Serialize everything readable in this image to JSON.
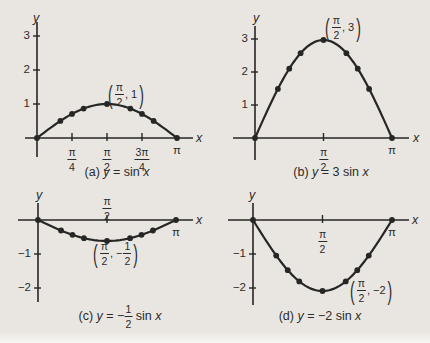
{
  "page": {
    "background": "#e9e6e1",
    "ink": "#262626"
  },
  "chart_data": [
    {
      "id": "a",
      "type": "line",
      "caption_segments": [
        {
          "text": "(a) "
        },
        {
          "text": "y",
          "italic": true
        },
        {
          "text": " = sin "
        },
        {
          "text": "x",
          "italic": true
        }
      ],
      "amplitude": 1,
      "x_axis": {
        "label": "x",
        "range_over_pi": [
          0,
          1
        ],
        "ticks": [
          {
            "value_over_pi": 0.25,
            "frac": [
              "π",
              "4"
            ],
            "side": "below",
            "mark": true
          },
          {
            "value_over_pi": 0.5,
            "frac": [
              "π",
              "2"
            ],
            "side": "below",
            "mark": true
          },
          {
            "value_over_pi": 0.75,
            "frac": [
              "3π",
              "4"
            ],
            "side": "below",
            "mark": true
          },
          {
            "value_over_pi": 1,
            "label": "π",
            "side": "below",
            "mark": false
          }
        ]
      },
      "y_axis": {
        "label": "y",
        "ticks": [
          {
            "value": 1,
            "label": "1"
          },
          {
            "value": 2,
            "label": "2"
          },
          {
            "value": 3,
            "label": "3"
          }
        ],
        "lim": [
          0,
          3.5
        ]
      },
      "points": [
        {
          "x_over_pi": 0,
          "y": 0
        },
        {
          "x_over_pi": 0.167,
          "y": 0.5
        },
        {
          "x_over_pi": 0.25,
          "y": 0.707
        },
        {
          "x_over_pi": 0.333,
          "y": 0.866
        },
        {
          "x_over_pi": 0.5,
          "y": 1
        },
        {
          "x_over_pi": 0.667,
          "y": 0.866
        },
        {
          "x_over_pi": 0.75,
          "y": 0.707
        },
        {
          "x_over_pi": 0.833,
          "y": 0.5
        },
        {
          "x_over_pi": 1,
          "y": 0
        }
      ],
      "annotation": {
        "parts": [
          {
            "frac": [
              "π",
              "2"
            ]
          },
          {
            "text": ", 1"
          }
        ]
      }
    },
    {
      "id": "b",
      "type": "line",
      "caption_segments": [
        {
          "text": "(b) "
        },
        {
          "text": "y",
          "italic": true
        },
        {
          "text": " = 3 sin "
        },
        {
          "text": "x",
          "italic": true
        }
      ],
      "amplitude": 3,
      "x_axis": {
        "label": "x",
        "range_over_pi": [
          0,
          1
        ],
        "ticks": [
          {
            "value_over_pi": 0.5,
            "frac": [
              "π",
              "2"
            ],
            "side": "below",
            "mark": true
          },
          {
            "value_over_pi": 1,
            "label": "π",
            "side": "below",
            "mark": false
          }
        ]
      },
      "y_axis": {
        "label": "y",
        "ticks": [
          {
            "value": 1,
            "label": "1"
          },
          {
            "value": 2,
            "label": "2"
          },
          {
            "value": 3,
            "label": "3"
          }
        ],
        "lim": [
          0,
          3.5
        ]
      },
      "points": [
        {
          "x_over_pi": 0,
          "y": 0
        },
        {
          "x_over_pi": 0.167,
          "y": 1.5
        },
        {
          "x_over_pi": 0.25,
          "y": 2.121
        },
        {
          "x_over_pi": 0.333,
          "y": 2.598
        },
        {
          "x_over_pi": 0.5,
          "y": 3
        },
        {
          "x_over_pi": 0.667,
          "y": 2.598
        },
        {
          "x_over_pi": 0.75,
          "y": 2.121
        },
        {
          "x_over_pi": 0.833,
          "y": 1.5
        },
        {
          "x_over_pi": 1,
          "y": 0
        }
      ],
      "annotation": {
        "parts": [
          {
            "frac": [
              "π",
              "2"
            ]
          },
          {
            "text": ", 3"
          }
        ]
      }
    },
    {
      "id": "c",
      "type": "line",
      "caption_segments": [
        {
          "text": "(c) "
        },
        {
          "text": "y",
          "italic": true
        },
        {
          "text": " = −"
        },
        {
          "frac": [
            "1",
            "2"
          ]
        },
        {
          "text": " sin "
        },
        {
          "text": "x",
          "italic": true
        }
      ],
      "amplitude": -0.5,
      "x_axis": {
        "label": "x",
        "range_over_pi": [
          0,
          1
        ],
        "ticks": [
          {
            "value_over_pi": 0.5,
            "frac": [
              "π",
              "2"
            ],
            "side": "above",
            "mark": true
          },
          {
            "value_over_pi": 1,
            "label": "π",
            "side": "below",
            "mark": false
          }
        ]
      },
      "y_axis": {
        "label": "y",
        "ticks": [
          {
            "value": -1,
            "label": "−1"
          },
          {
            "value": -2,
            "label": "−2"
          }
        ],
        "lim": [
          -2.4,
          0.8
        ]
      },
      "points": [
        {
          "x_over_pi": 0,
          "y": 0
        },
        {
          "x_over_pi": 0.167,
          "y": -0.25
        },
        {
          "x_over_pi": 0.25,
          "y": -0.354
        },
        {
          "x_over_pi": 0.333,
          "y": -0.433
        },
        {
          "x_over_pi": 0.5,
          "y": -0.5
        },
        {
          "x_over_pi": 0.667,
          "y": -0.433
        },
        {
          "x_over_pi": 0.75,
          "y": -0.354
        },
        {
          "x_over_pi": 0.833,
          "y": -0.25
        },
        {
          "x_over_pi": 1,
          "y": 0
        }
      ],
      "annotation": {
        "parts": [
          {
            "frac": [
              "π",
              "2"
            ]
          },
          {
            "text": ", −"
          },
          {
            "frac": [
              "1",
              "2"
            ]
          }
        ]
      }
    },
    {
      "id": "d",
      "type": "line",
      "caption_segments": [
        {
          "text": "(d) "
        },
        {
          "text": "y",
          "italic": true
        },
        {
          "text": " = −2 sin "
        },
        {
          "text": "x",
          "italic": true
        }
      ],
      "amplitude": -2,
      "x_axis": {
        "label": "x",
        "range_over_pi": [
          0,
          1
        ],
        "ticks": [
          {
            "value_over_pi": 0.5,
            "frac": [
              "π",
              "2"
            ],
            "side": "below",
            "mark": true
          },
          {
            "value_over_pi": 1,
            "label": "π",
            "side": "below",
            "mark": false
          }
        ]
      },
      "y_axis": {
        "label": "y",
        "ticks": [
          {
            "value": -1,
            "label": "−1"
          },
          {
            "value": -2,
            "label": "−2"
          }
        ],
        "lim": [
          -2.4,
          0.7
        ]
      },
      "points": [
        {
          "x_over_pi": 0,
          "y": 0
        },
        {
          "x_over_pi": 0.167,
          "y": -1
        },
        {
          "x_over_pi": 0.25,
          "y": -1.414
        },
        {
          "x_over_pi": 0.333,
          "y": -1.732
        },
        {
          "x_over_pi": 0.5,
          "y": -2
        },
        {
          "x_over_pi": 0.667,
          "y": -1.732
        },
        {
          "x_over_pi": 0.75,
          "y": -1.414
        },
        {
          "x_over_pi": 0.833,
          "y": -1
        },
        {
          "x_over_pi": 1,
          "y": 0
        }
      ],
      "annotation": {
        "parts": [
          {
            "frac": [
              "π",
              "2"
            ]
          },
          {
            "text": ", −2"
          }
        ]
      }
    }
  ]
}
